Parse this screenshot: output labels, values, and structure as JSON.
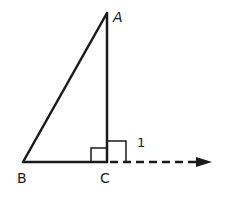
{
  "diagram": {
    "type": "geometry",
    "vertices": {
      "A": {
        "label": "A"
      },
      "B": {
        "label": "B"
      },
      "C": {
        "label": "C"
      }
    },
    "angle_labels": {
      "exterior": "1"
    },
    "colors": {
      "stroke": "#1a1a1a",
      "background": "#ffffff"
    }
  }
}
